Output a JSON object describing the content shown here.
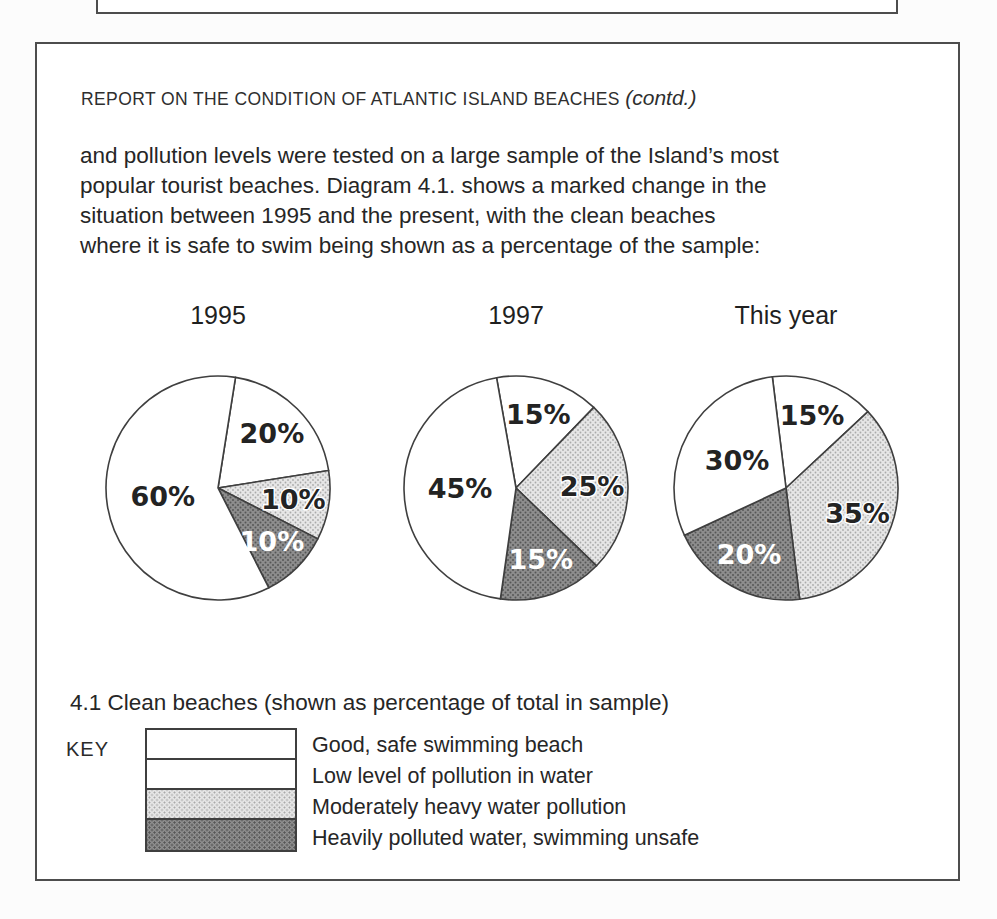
{
  "page": {
    "header": {
      "title_caps": "REPORT ON THE CONDITION OF ATLANTIC ISLAND BEACHES ",
      "contd": "(contd.)"
    },
    "paragraph_lines": [
      "and pollution levels were tested on a large sample of the Island’s most",
      "popular tourist beaches. Diagram 4.1. shows a marked change in the",
      "situation between 1995 and the present, with the clean beaches",
      "where it is safe to swim being shown as a percentage of the sample:"
    ],
    "caption": "4.1 Clean beaches (shown as percentage of total in sample)",
    "key": {
      "label": "KEY",
      "entries": [
        {
          "category": "good",
          "swatch": "white",
          "label": "Good, safe swimming beach"
        },
        {
          "category": "low",
          "swatch": "white",
          "label": "Low level of pollution in water"
        },
        {
          "category": "moderate",
          "swatch": "light-halftone",
          "label": "Moderately heavy water pollution"
        },
        {
          "category": "heavy",
          "swatch": "dark-halftone",
          "label": "Heavily polluted water, swimming unsafe"
        }
      ]
    },
    "colors": {
      "box_border": "#4d4d4d",
      "text": "#262626",
      "slice_outline": "#3f3f3f",
      "moderate_fill": "#e6e6e6",
      "heavy_fill": "#8d8d8d",
      "heavy_label_text": "#ffffff"
    }
  },
  "chart_data": [
    {
      "type": "pie",
      "title": "1995",
      "units": "percent",
      "start_angle_deg": 9,
      "slices": [
        {
          "category": "low",
          "label": "20%",
          "value": 20
        },
        {
          "category": "moderate",
          "label": "10%",
          "value": 10
        },
        {
          "category": "heavy",
          "label": "10%",
          "value": 10
        },
        {
          "category": "good",
          "label": "60%",
          "value": 60
        }
      ]
    },
    {
      "type": "pie",
      "title": "1997",
      "units": "percent",
      "start_angle_deg": -10,
      "slices": [
        {
          "category": "low",
          "label": "15%",
          "value": 15
        },
        {
          "category": "moderate",
          "label": "25%",
          "value": 25
        },
        {
          "category": "heavy",
          "label": "15%",
          "value": 15
        },
        {
          "category": "good",
          "label": "45%",
          "value": 45
        }
      ]
    },
    {
      "type": "pie",
      "title": "This year",
      "units": "percent",
      "start_angle_deg": -7,
      "slices": [
        {
          "category": "low",
          "label": "15%",
          "value": 15
        },
        {
          "category": "moderate",
          "label": "35%",
          "value": 35
        },
        {
          "category": "heavy",
          "label": "20%",
          "value": 20
        },
        {
          "category": "good",
          "label": "30%",
          "value": 30
        }
      ]
    }
  ]
}
